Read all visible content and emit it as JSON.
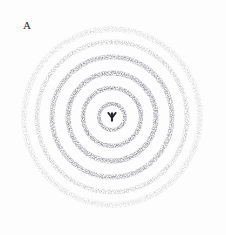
{
  "figure": {
    "panel_label": "A",
    "caption_text": "",
    "width_px": 226,
    "height_px": 235,
    "background_color": "#fdfdfd",
    "ink_color": "#3a3a44",
    "medium": "scanned photographic film"
  },
  "chart_data": {
    "type": "scatter",
    "title": "A",
    "subtitle": "",
    "xlabel": "",
    "ylabel": "",
    "plot_kind": "powder-diffraction-debye-scherrer-rings",
    "grid": false,
    "legend": "none",
    "axes_visible": false,
    "tick_labels": [],
    "annotations": [
      "A"
    ],
    "center": {
      "x": 112,
      "y": 117
    },
    "beamstop": {
      "present": true,
      "shape": "trident",
      "x": 112,
      "y": 117,
      "radius": 5,
      "color": "#1d1d22"
    },
    "units": "pixels",
    "radius_range": [
      0,
      95
    ],
    "series": [
      {
        "name": "diffraction rings",
        "points": [
          {
            "index": 1,
            "radius": 13,
            "width": 4.0,
            "intensity": 0.8,
            "color": "#4a4a54"
          },
          {
            "index": 2,
            "radius": 29,
            "width": 4.5,
            "intensity": 0.7,
            "color": "#50505a"
          },
          {
            "index": 3,
            "radius": 44,
            "width": 5.0,
            "intensity": 0.62,
            "color": "#55555f"
          },
          {
            "index": 4,
            "radius": 60,
            "width": 5.0,
            "intensity": 0.5,
            "color": "#5c5c66"
          },
          {
            "index": 5,
            "radius": 75,
            "width": 5.0,
            "intensity": 0.34,
            "color": "#6e6e78"
          },
          {
            "index": 6,
            "radius": 88,
            "width": 6.0,
            "intensity": 0.18,
            "color": "#8c8c96"
          }
        ]
      }
    ],
    "halo": {
      "present": true,
      "inner_radius": 0,
      "outer_radius": 95,
      "intensity": 0.06
    },
    "grain": {
      "present": true,
      "description": "film grain speckle across rings"
    }
  }
}
